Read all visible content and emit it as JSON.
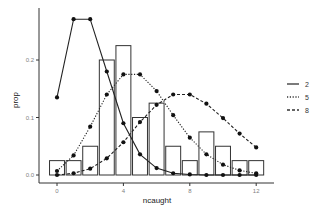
{
  "chart_data": {
    "type": "bar",
    "title": "",
    "xlabel": "ncaught",
    "ylabel": "prop",
    "x": [
      0,
      1,
      2,
      3,
      4,
      5,
      6,
      7,
      8,
      9,
      10,
      11,
      12
    ],
    "xticks": [
      0,
      4,
      8,
      12
    ],
    "xtick_labels": [
      "0",
      "4",
      "8",
      "12"
    ],
    "yticks": [
      0.0,
      0.1,
      0.2
    ],
    "ytick_labels": [
      "0.0",
      "0.1",
      "0.2"
    ],
    "xlim": [
      -1,
      13
    ],
    "ylim": [
      0,
      0.28
    ],
    "grid": false,
    "bars": {
      "name": "observed proportion",
      "values": [
        0.025,
        0.025,
        0.05,
        0.2,
        0.225,
        0.1,
        0.125,
        0.05,
        0.025,
        0.075,
        0.05,
        0.025,
        0.025
      ]
    },
    "series": [
      {
        "name": "2",
        "style": "solid",
        "values": [
          0.135,
          0.271,
          0.271,
          0.18,
          0.09,
          0.036,
          0.012,
          0.003,
          0.001,
          0.0,
          0.0,
          0.0,
          0.0
        ]
      },
      {
        "name": "5",
        "style": "dotted",
        "values": [
          0.007,
          0.034,
          0.084,
          0.14,
          0.175,
          0.175,
          0.146,
          0.104,
          0.065,
          0.036,
          0.018,
          0.008,
          0.003
        ]
      },
      {
        "name": "8",
        "style": "dashed",
        "values": [
          0.0,
          0.003,
          0.011,
          0.029,
          0.057,
          0.092,
          0.122,
          0.14,
          0.14,
          0.124,
          0.099,
          0.072,
          0.048
        ]
      }
    ],
    "legend": {
      "position": "right",
      "title": "",
      "entries": [
        "2",
        "5",
        "8"
      ]
    }
  }
}
